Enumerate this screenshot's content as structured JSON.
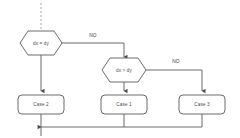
{
  "diagram": {
    "background_color": "#ffffff",
    "line_color": "#6b6b6b",
    "text_color": "#4a4a4a",
    "dashed_line_color": "#a8a8a8"
  },
  "nodes": {
    "decision_1": {
      "label": "dx = dy",
      "shape": "hexagon"
    },
    "decision_2": {
      "label": "dx > dy",
      "shape": "hexagon"
    },
    "case_2": {
      "label": "Case 2",
      "shape": "rounded-rectangle"
    },
    "case_1": {
      "label": "Case 1",
      "shape": "rounded-rectangle"
    },
    "case_3": {
      "label": "Case 3",
      "shape": "rounded-rectangle"
    }
  },
  "edges": {
    "no_branch_1": {
      "label": "NO"
    },
    "no_branch_2": {
      "label": "NO"
    }
  }
}
